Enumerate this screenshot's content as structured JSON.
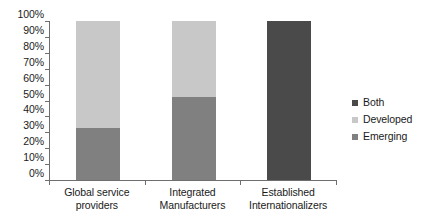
{
  "chart_data": {
    "type": "bar",
    "subtype": "100-percent-stacked-column",
    "title": "",
    "subtitle": "",
    "xlabel": "",
    "ylabel": "",
    "categories": [
      "Global service providers",
      "Integrated Manufacturers",
      "Established Internationalizers"
    ],
    "category_lines": [
      [
        "Global service",
        "providers"
      ],
      [
        "Integrated",
        "Manufacturers"
      ],
      [
        "Established",
        "Internationalizers"
      ]
    ],
    "series": [
      {
        "name": "Emerging",
        "color": "#808080",
        "values": [
          33,
          52,
          0
        ]
      },
      {
        "name": "Developed",
        "color": "#c8c8c8",
        "values": [
          67,
          48,
          0
        ]
      },
      {
        "name": "Both",
        "color": "#4a4a4a",
        "values": [
          0,
          0,
          100
        ]
      }
    ],
    "ylim": [
      0,
      100
    ],
    "ytick_values": [
      0,
      10,
      20,
      30,
      40,
      50,
      60,
      70,
      80,
      90,
      100
    ],
    "ytick_labels": [
      "0%",
      "10%",
      "20%",
      "30%",
      "40%",
      "50%",
      "60%",
      "70%",
      "80%",
      "90%",
      "100%"
    ],
    "grid": false,
    "legend_position": "right",
    "legend_order": [
      "Both",
      "Developed",
      "Emerging"
    ],
    "background": "#ffffff",
    "axis_color": "#6e6e6e",
    "text_color": "#1a1a1a"
  },
  "legend": {
    "items": [
      {
        "label": "Both",
        "color": "#4a4a4a"
      },
      {
        "label": "Developed",
        "color": "#c8c8c8"
      },
      {
        "label": "Emerging",
        "color": "#808080"
      }
    ]
  }
}
